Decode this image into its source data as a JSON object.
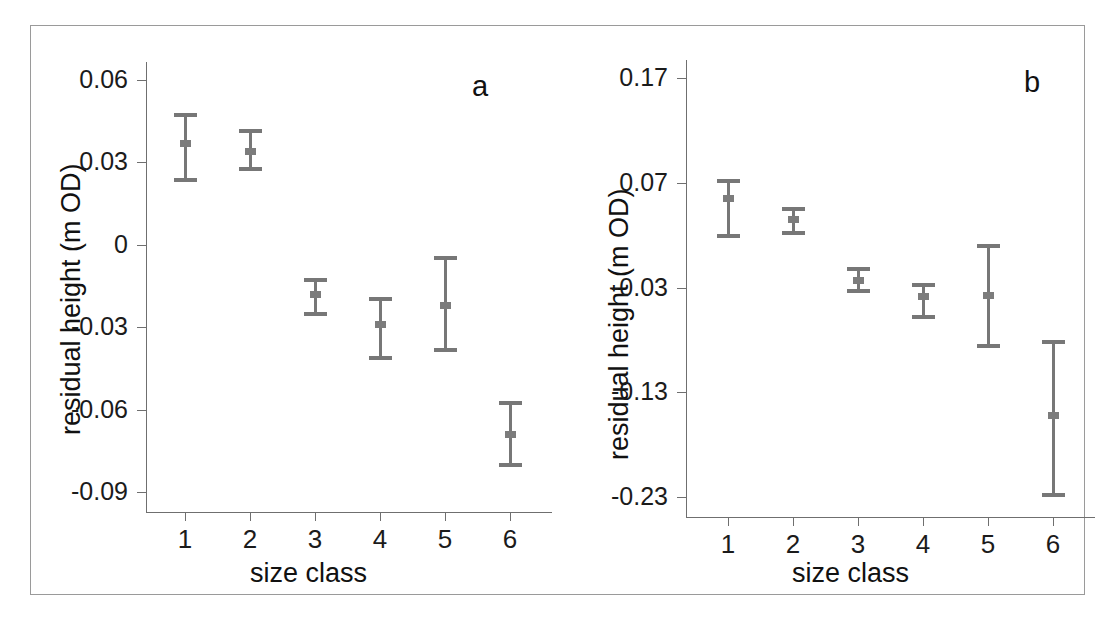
{
  "figure": {
    "panel_a_label": "a",
    "panel_b_label": "b"
  },
  "chart_data": [
    {
      "type": "scatter",
      "panel": "a",
      "title": "a",
      "xlabel": "size class",
      "ylabel": "residual height (m OD)",
      "categories": [
        "1",
        "2",
        "3",
        "4",
        "5",
        "6"
      ],
      "x": [
        1,
        2,
        3,
        4,
        5,
        6
      ],
      "values": [
        0.037,
        0.034,
        -0.018,
        -0.029,
        -0.022,
        -0.069
      ],
      "error_low": [
        0.023,
        0.027,
        -0.026,
        -0.042,
        -0.039,
        -0.081
      ],
      "error_high": [
        0.048,
        0.042,
        -0.012,
        -0.019,
        -0.004,
        -0.057
      ],
      "yticks": [
        0.06,
        0.03,
        0,
        -0.03,
        -0.06,
        -0.09
      ],
      "ytick_labels": [
        "0.06",
        "0.03",
        "0",
        "-0.03",
        "-0.06",
        "-0.09"
      ],
      "ylim": [
        -0.09,
        0.06
      ],
      "xlim": [
        0.5,
        6.5
      ],
      "grid": false,
      "legend": "none",
      "marker_color": "#7c7c7c",
      "axis_color": "#6f6f6f"
    },
    {
      "type": "scatter",
      "panel": "b",
      "title": "b",
      "xlabel": "size class",
      "ylabel": "residual height (m OD)",
      "categories": [
        "1",
        "2",
        "3",
        "4",
        "5",
        "6"
      ],
      "x": [
        1,
        2,
        3,
        4,
        5,
        6
      ],
      "values": [
        0.055,
        0.035,
        -0.023,
        -0.038,
        -0.037,
        -0.152
      ],
      "error_low": [
        0.017,
        0.02,
        -0.035,
        -0.06,
        -0.088,
        -0.23
      ],
      "error_high": [
        0.074,
        0.047,
        -0.01,
        -0.026,
        0.012,
        -0.08
      ],
      "yticks": [
        0.17,
        0.07,
        -0.03,
        -0.13,
        -0.23
      ],
      "ytick_labels": [
        "0.17",
        "0.07",
        "-0.03",
        "-0.13",
        "-0.23"
      ],
      "ylim": [
        -0.23,
        0.17
      ],
      "xlim": [
        0.5,
        6.5
      ],
      "grid": false,
      "legend": "none",
      "marker_color": "#7c7c7c",
      "axis_color": "#6f6f6f"
    }
  ]
}
